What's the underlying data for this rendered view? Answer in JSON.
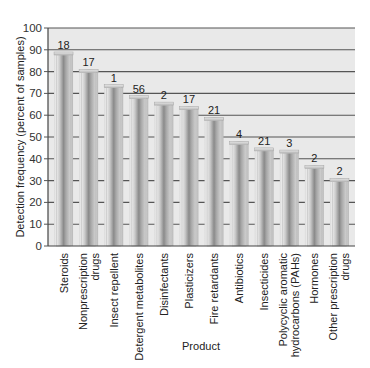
{
  "chart_data": {
    "type": "bar",
    "title": "",
    "xlabel": "Product",
    "ylabel": "Detection frequency (percent of samples)",
    "ylim": [
      0,
      100
    ],
    "yticks": [
      0,
      10,
      20,
      30,
      40,
      50,
      60,
      70,
      80,
      90,
      100
    ],
    "grid": true,
    "legend": null,
    "categories": [
      [
        "Steroids"
      ],
      [
        "Nonprescription",
        "drugs"
      ],
      [
        "Insect repellent"
      ],
      [
        "Detergent metabolites"
      ],
      [
        "Disinfectants"
      ],
      [
        "Plasticizers"
      ],
      [
        "Fire retardants"
      ],
      [
        "Antibiotics"
      ],
      [
        "Insecticides"
      ],
      [
        "Polycyclic aromatic",
        "hydrocarbons (PAHs)"
      ],
      [
        "Hormones"
      ],
      [
        "Other prescription",
        "drugs"
      ]
    ],
    "values": [
      89,
      81,
      74,
      69,
      66,
      64,
      59,
      48,
      45,
      44,
      37,
      31
    ],
    "annotations": [
      "18",
      "17",
      "1",
      "56",
      "2",
      "17",
      "21",
      "4",
      "21",
      "3",
      "2",
      "2"
    ],
    "annotation_meaning": "number above each bar",
    "colors": {
      "plot_background": "#e9e9e9",
      "gridline": "#555555",
      "bar_light": "#e4e4e4",
      "bar_mid": "#b5b5b5",
      "bar_dark": "#7d7d7d"
    }
  }
}
